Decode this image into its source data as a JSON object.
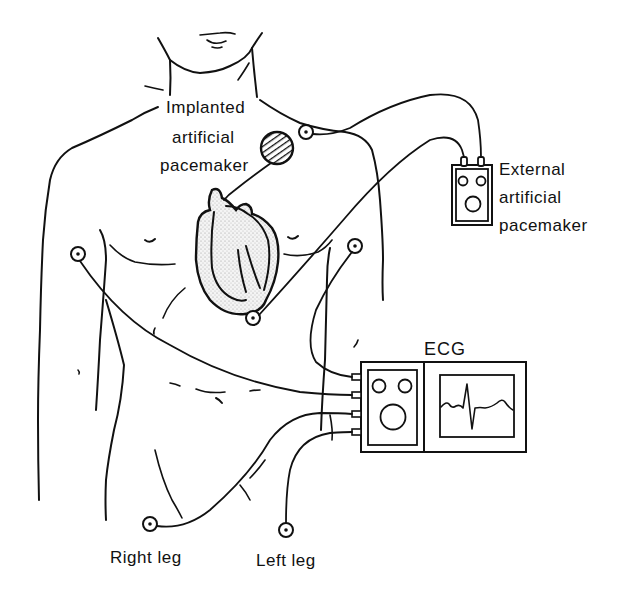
{
  "figure": {
    "labels": {
      "implanted": [
        "Implanted",
        "artificial",
        "pacemaker"
      ],
      "external": [
        "External",
        "artificial",
        "pacemaker"
      ],
      "ecg": "ECG",
      "right_leg": "Right leg",
      "left_leg": "Left leg"
    },
    "components": [
      {
        "name": "implanted-pacemaker",
        "shape": "hatched-circle"
      },
      {
        "name": "external-pacemaker",
        "shape": "box-with-two-knobs-and-dial"
      },
      {
        "name": "ecg-monitor",
        "shape": "box-with-controls-and-waveform-screen",
        "leads": 4
      },
      {
        "name": "heart",
        "shape": "stippled-heart"
      }
    ],
    "electrodes": [
      "left-shoulder",
      "right-chest",
      "left-chest",
      "heart-apex",
      "right-leg",
      "left-leg"
    ],
    "colors": {
      "ink": "#111111",
      "background": "#ffffff",
      "stipple": "#d8d8d8"
    }
  }
}
